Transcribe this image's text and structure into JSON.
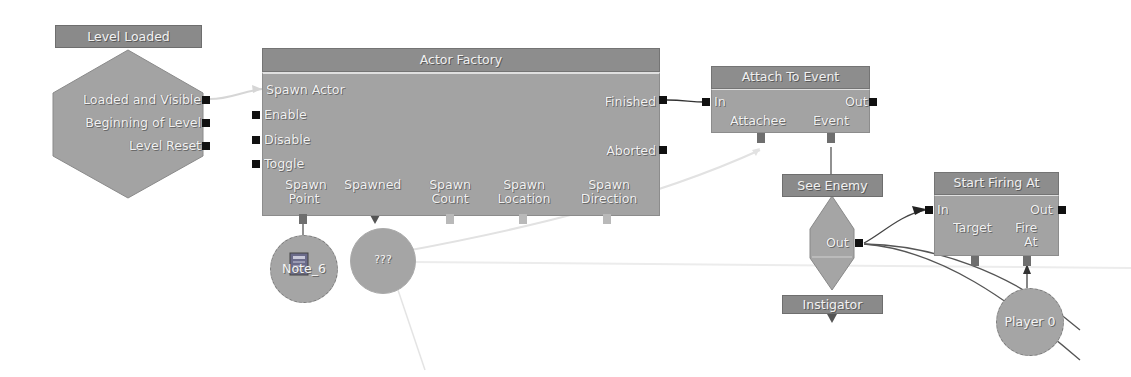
{
  "canvas": {
    "background": "#ffffff",
    "node_fill": "#a3a3a3",
    "header_fill": "#8a8a8a",
    "pin_color": "#111111"
  },
  "event_level_loaded": {
    "title": "Level Loaded",
    "outputs": [
      "Loaded and Visible",
      "Beginning of Level",
      "Level Reset"
    ]
  },
  "actor_factory": {
    "title": "Actor Factory",
    "inputs": [
      "Spawn Actor",
      "Enable",
      "Disable",
      "Toggle"
    ],
    "outputs": [
      "Finished",
      "Aborted"
    ],
    "variables": [
      {
        "line1": "Spawn",
        "line2": "Point"
      },
      {
        "line1": "Spawned",
        "line2": ""
      },
      {
        "line1": "Spawn",
        "line2": "Count"
      },
      {
        "line1": "Spawn",
        "line2": "Location"
      },
      {
        "line1": "Spawn",
        "line2": "Direction"
      }
    ]
  },
  "attach_to_event": {
    "title": "Attach To Event",
    "input": "In",
    "output": "Out",
    "variables": [
      "Attachee",
      "Event"
    ]
  },
  "see_enemy": {
    "title": "See Enemy",
    "output": "Out",
    "variable": "Instigator"
  },
  "start_firing_at": {
    "title": "Start Firing At",
    "input": "In",
    "output": "Out",
    "variables": [
      {
        "line1": "Target",
        "line2": ""
      },
      {
        "line1": "Fire",
        "line2": "At"
      }
    ]
  },
  "variables": {
    "note": "Note_6",
    "unknown": "???",
    "player": "Player 0"
  }
}
